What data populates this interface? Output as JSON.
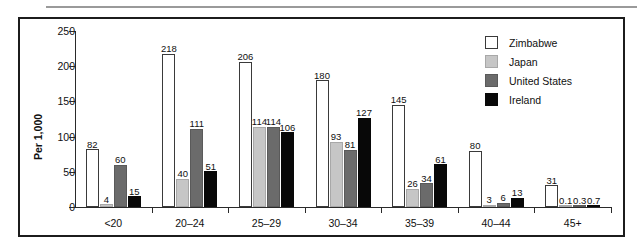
{
  "chart_data": {
    "type": "bar",
    "title": "",
    "xlabel": "",
    "ylabel": "Per 1,000",
    "ylim": [
      0,
      250
    ],
    "yticks": [
      0,
      50,
      100,
      150,
      200,
      250
    ],
    "ytick_labels": [
      "0",
      "50",
      "100",
      "150",
      "200",
      "250"
    ],
    "grid": false,
    "legend_position": "top-right",
    "categories": [
      "<20",
      "20–24",
      "25–29",
      "30–34",
      "35–39",
      "40–44",
      "45+"
    ],
    "series": [
      {
        "name": "Zimbabwe",
        "color": "#ffffff",
        "values": [
          82,
          218,
          206,
          180,
          145,
          80,
          31
        ],
        "labels": [
          "82",
          "218",
          "206",
          "180",
          "145",
          "80",
          "31"
        ]
      },
      {
        "name": "Japan",
        "color": "#c6c6c6",
        "values": [
          4,
          40,
          114,
          93,
          26,
          3,
          0.1
        ],
        "labels": [
          "4",
          "40",
          "114",
          "93",
          "26",
          "3",
          "0.1"
        ]
      },
      {
        "name": "United States",
        "color": "#6b6b6b",
        "values": [
          60,
          111,
          114,
          81,
          34,
          6,
          0.3
        ],
        "labels": [
          "60",
          "111",
          "114",
          "81",
          "34",
          "6",
          "0.3"
        ]
      },
      {
        "name": "Ireland",
        "color": "#080808",
        "values": [
          15,
          51,
          106,
          127,
          61,
          13,
          0.7
        ],
        "labels": [
          "15",
          "51",
          "106",
          "127",
          "61",
          "13",
          "0.7"
        ]
      }
    ]
  },
  "legend": {
    "items": [
      {
        "label": "Zimbabwe"
      },
      {
        "label": "Japan"
      },
      {
        "label": "United States"
      },
      {
        "label": "Ireland"
      }
    ]
  }
}
